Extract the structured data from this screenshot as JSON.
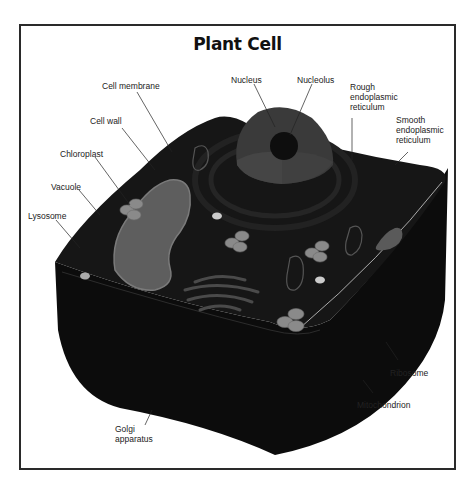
{
  "diagram": {
    "title": "Plant Cell",
    "labels": {
      "cell_membrane": "Cell membrane",
      "nucleus": "Nucleus",
      "nucleolus": "Nucleolus",
      "rough_er": "Rough\nendoplasmic\nreticulum",
      "smooth_er": "Smooth\nendoplasmic\nreticulum",
      "cell_wall": "Cell wall",
      "chloroplast": "Chloroplast",
      "vacuole": "Vacuole",
      "lysosome": "Lysosome",
      "ribosome": "Ribosome",
      "mitochondrion": "Mitochondrion",
      "golgi": "Golgi\napparatus"
    },
    "colors": {
      "cell_body": "#141414",
      "cell_side": "#0c0c0c",
      "nucleus": "#3a3a3a",
      "nucleolus": "#0e0e0e",
      "vacuole": "#5e5e5e",
      "chloroplast": "#8a8a8a",
      "frame": "#2a2a2a"
    }
  }
}
